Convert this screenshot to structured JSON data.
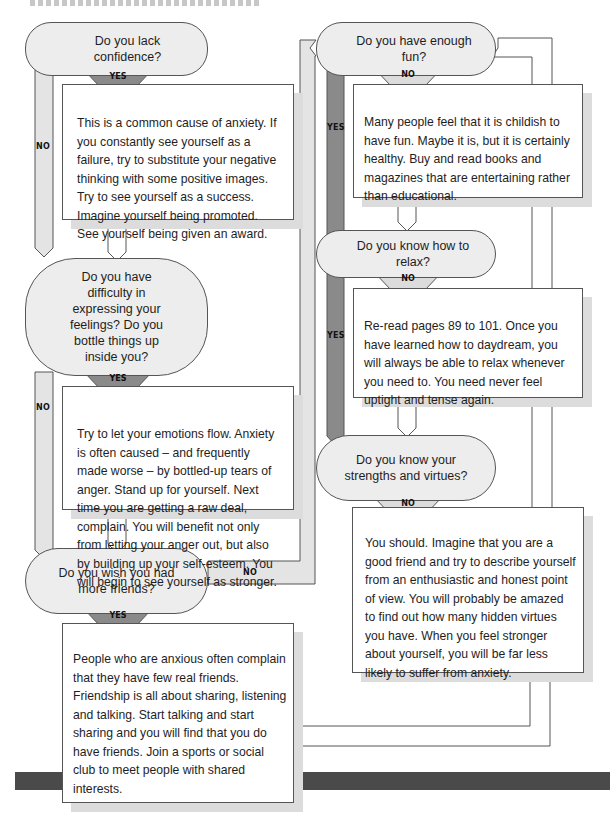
{
  "flowchart": {
    "colors": {
      "question_fill": "#ededed",
      "yes_arrow": "#8a8a8a",
      "no_arrow": "#dcdcdc",
      "outline": "#555555",
      "shadow": "#dcdcdc",
      "band": "#4a4a4a"
    },
    "nodes": [
      {
        "id": "q1",
        "question": "Do you lack confidence?",
        "yes_label": "YES",
        "no_label": "NO",
        "advice": "This is a common cause of anxiety. If you constantly see yourself as a failure, try to substitute your negative thinking with some positive images. Try to see yourself as a success. Imagine yourself being promoted. See yourself being given an award."
      },
      {
        "id": "q2",
        "question": "Do you have difficulty in expressing your feelings? Do you bottle things up inside you?",
        "yes_label": "YES",
        "no_label": "NO",
        "advice": "Try to let your emotions flow. Anxiety is often caused – and frequently made worse – by bottled-up tears of anger. Stand up for yourself. Next time you are getting a raw deal, complain. You will benefit not only from letting your anger out, but also by building up your self-esteem. You will begin to see yourself as stronger."
      },
      {
        "id": "q3",
        "question": "Do you wish you had more friends?",
        "yes_label": "YES",
        "no_label": "NO",
        "advice": "People who are anxious often complain that they have few real friends. Friendship is all about sharing, listening and talking. Start talking and start sharing and you will find that you do have friends. Join a sports or social club to meet people with shared interests."
      },
      {
        "id": "q4",
        "question": "Do you have enough fun?",
        "yes_label": "YES",
        "no_label": "NO",
        "advice": "Many people feel that it is childish to have fun. Maybe it is, but it is certainly healthy. Buy and read books and magazines that are entertaining rather than educational."
      },
      {
        "id": "q5",
        "question": "Do you know how to relax?",
        "yes_label": "YES",
        "no_label": "NO",
        "advice": "Re-read pages 89 to 101. Once you have learned how to daydream, you will always be able to relax whenever you need to. You need never feel uptight and tense again."
      },
      {
        "id": "q6",
        "question": "Do you know your strengths and virtues?",
        "no_label": "NO",
        "advice": "You should. Imagine that you are a good friend and try to describe yourself from an enthusiastic and honest point of view. You will probably be amazed to find out how many hidden virtues you have. When you feel stronger about yourself, you will be far less likely to suffer from anxiety."
      }
    ]
  }
}
